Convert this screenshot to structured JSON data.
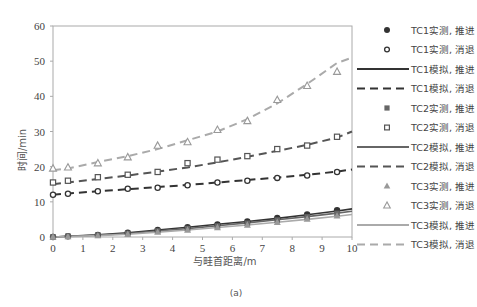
{
  "chart_data": {
    "type": "line",
    "title": "",
    "caption": "(a)",
    "xlabel": "与畦首距离/m",
    "ylabel": "时间/min",
    "xlim": [
      0,
      10
    ],
    "ylim": [
      0,
      60
    ],
    "x_ticks": [
      0,
      1,
      2,
      3,
      4,
      5,
      6,
      7,
      8,
      9,
      10
    ],
    "y_ticks": [
      0,
      10,
      20,
      30,
      40,
      50,
      60
    ],
    "grid": false,
    "legend_position": "right",
    "x_measured": [
      0,
      0.5,
      1.5,
      2.5,
      3.5,
      4.5,
      5.5,
      6.5,
      7.5,
      8.5,
      9.5
    ],
    "x_simulated": [
      0,
      0.5,
      1.5,
      2.5,
      3.5,
      4.5,
      5.5,
      6.5,
      7.5,
      8.5,
      9.5,
      10
    ],
    "series": [
      {
        "name": "TC1实测, 推进",
        "kind": "marker",
        "marker": "filled-circle",
        "color": "#333333",
        "values": [
          0,
          0.2,
          0.6,
          1.2,
          2.0,
          2.8,
          3.6,
          4.4,
          5.4,
          6.4,
          7.6
        ]
      },
      {
        "name": "TC1实测, 消退",
        "kind": "marker",
        "marker": "open-circle",
        "color": "#333333",
        "values": [
          12.0,
          12.3,
          13.0,
          13.7,
          14.0,
          14.7,
          15.5,
          16.0,
          16.8,
          17.5,
          18.5
        ]
      },
      {
        "name": "TC1模拟, 推进",
        "kind": "line",
        "dash": "solid",
        "color": "#333333",
        "values": [
          0,
          0.2,
          0.6,
          1.2,
          2.0,
          2.8,
          3.6,
          4.4,
          5.3,
          6.3,
          7.4,
          8.0
        ]
      },
      {
        "name": "TC1模拟, 消退",
        "kind": "line",
        "dash": "dashed",
        "color": "#333333",
        "values": [
          12.0,
          12.4,
          13.0,
          13.6,
          14.2,
          14.8,
          15.5,
          16.2,
          16.9,
          17.7,
          18.6,
          19.2
        ]
      },
      {
        "name": "TC2实测, 推进",
        "kind": "marker",
        "marker": "filled-square",
        "color": "#666666",
        "values": [
          0,
          0.2,
          0.5,
          1.0,
          1.7,
          2.4,
          3.1,
          3.9,
          4.8,
          5.7,
          6.7
        ]
      },
      {
        "name": "TC2实测, 消退",
        "kind": "marker",
        "marker": "open-square",
        "color": "#555555",
        "values": [
          15.5,
          16.0,
          17.0,
          17.7,
          18.5,
          21.0,
          22.0,
          23.0,
          25.0,
          26.0,
          28.5
        ]
      },
      {
        "name": "TC2模拟, 推进",
        "kind": "line",
        "dash": "solid",
        "color": "#666666",
        "values": [
          0,
          0.2,
          0.5,
          1.0,
          1.7,
          2.4,
          3.2,
          4.0,
          4.9,
          5.8,
          6.8,
          7.3
        ]
      },
      {
        "name": "TC2模拟, 消退",
        "kind": "line",
        "dash": "dashed",
        "color": "#555555",
        "values": [
          15.0,
          15.5,
          16.5,
          17.5,
          18.6,
          19.8,
          21.2,
          22.8,
          24.5,
          26.2,
          28.3,
          30.0
        ]
      },
      {
        "name": "TC3实测, 推进",
        "kind": "marker",
        "marker": "filled-triangle",
        "color": "#999999",
        "values": [
          0,
          0.1,
          0.4,
          0.8,
          1.4,
          2.0,
          2.7,
          3.4,
          4.2,
          5.1,
          6.0
        ]
      },
      {
        "name": "TC3实测, 消退",
        "kind": "marker",
        "marker": "open-triangle",
        "color": "#999999",
        "values": [
          19.5,
          19.8,
          21.0,
          22.7,
          26.0,
          27.0,
          30.5,
          33.0,
          39.0,
          43.0,
          47.0
        ]
      },
      {
        "name": "TC3模拟, 推进",
        "kind": "line",
        "dash": "solid",
        "color": "#aaaaaa",
        "values": [
          0,
          0.1,
          0.4,
          0.8,
          1.4,
          2.0,
          2.7,
          3.4,
          4.2,
          5.0,
          5.9,
          6.4
        ]
      },
      {
        "name": "TC3模拟, 消退",
        "kind": "line",
        "dash": "dashed",
        "color": "#aaaaaa",
        "values": [
          19.0,
          19.5,
          21.3,
          23.0,
          25.0,
          27.5,
          30.0,
          33.5,
          38.0,
          43.5,
          49.5,
          51.0
        ]
      }
    ]
  }
}
